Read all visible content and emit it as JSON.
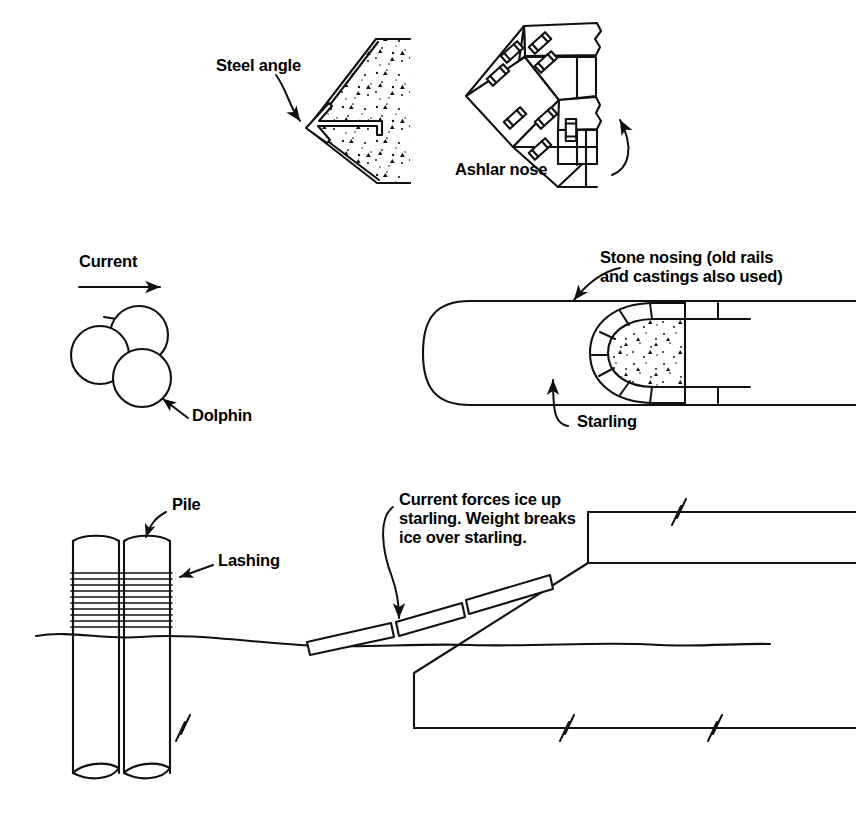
{
  "figure": {
    "kind": "engineering-line-diagram",
    "stroke_color": "#111111",
    "background_color": "#ffffff"
  },
  "panels": [
    {
      "id": "steel-angle-nose",
      "title_label": "Steel angle",
      "description": "Plan view of a V-shaped (pointed) concrete pier nose protected by a steel angle at the apex",
      "hatch": "concrete-stipple"
    },
    {
      "id": "ashlar-nose",
      "title_label": "Ashlar nose",
      "description": "Plan view of cut-stone ashlar blocks forming a pier nose, joined with metal cramps and dowels",
      "cramp_count": 8
    },
    {
      "id": "dolphin-cluster",
      "title_label": "Dolphin",
      "current_label": "Current",
      "description": "Plan view of a three-pile dolphin cluster wrapped by a lashing, facing the current",
      "pile_count": 3
    },
    {
      "id": "stone-nosing-starling",
      "nosing_label": "Stone nosing (old rails\nand castings also used)",
      "starling_label": "Starling",
      "description": "Plan view of a rounded starling with radial stone voussoir nosing around a concrete core",
      "voussoir_count": 8
    },
    {
      "id": "ice-breaking-section",
      "pile_label": "Pile",
      "lashing_label": "Lashing",
      "ice_label": "Current forces ice up\nstarling. Weight breaks\nice over starling.",
      "description": "Elevation/section showing piles with lashing at the waterline and ice sheets riding up an inclined starling face until they break",
      "lashing_band_count": 10,
      "ice_slab_count": 3,
      "break_mark_count": 4
    }
  ],
  "labels": {
    "steel_angle": "Steel angle",
    "ashlar_nose": "Ashlar nose",
    "current": "Current",
    "dolphin": "Dolphin",
    "stone_nosing": "Stone nosing (old rails\nand castings also used)",
    "starling": "Starling",
    "pile": "Pile",
    "lashing": "Lashing",
    "ice_note": "Current forces ice up\nstarling. Weight breaks\nice over starling."
  }
}
